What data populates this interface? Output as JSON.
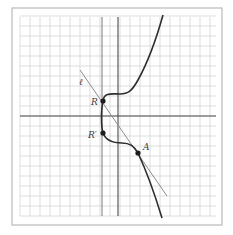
{
  "figure": {
    "type": "diagram",
    "frame": {
      "x": 12,
      "y": 8,
      "width": 210,
      "height": 217
    },
    "grid": {
      "x_start": 20,
      "x_end": 216,
      "y_start": 17,
      "y_end": 216,
      "spacing": 10
    },
    "axes": {
      "x_axis_y": 116,
      "y_axis_x": 118
    },
    "reference_vertical_x": 102,
    "labels": {
      "line": "ℓ",
      "R": "R",
      "R_prime": "R′",
      "A": "A"
    },
    "points": {
      "R": {
        "x": 103,
        "y": 101
      },
      "R_prime": {
        "x": 103,
        "y": 133
      },
      "A": {
        "x": 138,
        "y": 153
      }
    },
    "secant_line": {
      "x1": 80,
      "y1": 70,
      "x2": 167,
      "y2": 196
    },
    "colors": {
      "grid": "#d4d4d4",
      "axis": "#4a4a4a",
      "curve": "#2e2e2e",
      "secant": "#8c8c8c",
      "frame": "#b9b9b9"
    }
  }
}
